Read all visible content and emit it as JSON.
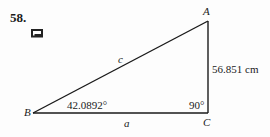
{
  "problem": {
    "number": "58.",
    "icon": "calculator-icon"
  },
  "triangle": {
    "vertices": {
      "A": "A",
      "B": "B",
      "C": "C"
    },
    "sides": {
      "hypotenuse": "c",
      "base": "a",
      "vertical_length": "56.851 cm"
    },
    "angles": {
      "B": "42.0892°",
      "C": "90°"
    },
    "line_color": "#1a1a1a"
  }
}
